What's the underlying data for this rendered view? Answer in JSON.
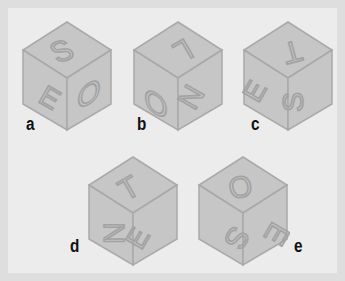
{
  "colors": {
    "frame": "#dedede",
    "panel": "#ececec",
    "face": "#c6c6c6",
    "edge": "#a9a9a9",
    "letter": "#a2a2a2",
    "label": "#111111"
  },
  "cubes": [
    {
      "label": "a",
      "top": "S",
      "left": "E",
      "right": "O"
    },
    {
      "label": "b",
      "top": "L",
      "left": "O",
      "right": "N"
    },
    {
      "label": "c",
      "top": "T",
      "left": "E",
      "right": "S"
    },
    {
      "label": "d",
      "top": "T",
      "left": "N",
      "right": "E"
    },
    {
      "label": "e",
      "top": "O",
      "left": "S",
      "right": "E"
    }
  ]
}
